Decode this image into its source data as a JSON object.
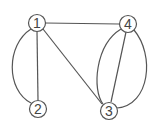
{
  "graph": {
    "nodes": [
      {
        "id": "1",
        "label": "1",
        "x": 37,
        "y": 23
      },
      {
        "id": "4",
        "label": "4",
        "x": 128,
        "y": 24
      },
      {
        "id": "2",
        "label": "2",
        "x": 38,
        "y": 109
      },
      {
        "id": "3",
        "label": "3",
        "x": 109,
        "y": 111
      }
    ],
    "edges": [
      {
        "from": "1",
        "to": "4",
        "type": "straight"
      },
      {
        "from": "1",
        "to": "2",
        "type": "straight"
      },
      {
        "from": "1",
        "to": "2",
        "type": "curved-left"
      },
      {
        "from": "1",
        "to": "3",
        "type": "straight"
      },
      {
        "from": "4",
        "to": "3",
        "type": "straight"
      },
      {
        "from": "4",
        "to": "3",
        "type": "curved-left"
      },
      {
        "from": "4",
        "to": "3",
        "type": "curved-right"
      }
    ],
    "stroke_color": "#555555"
  }
}
